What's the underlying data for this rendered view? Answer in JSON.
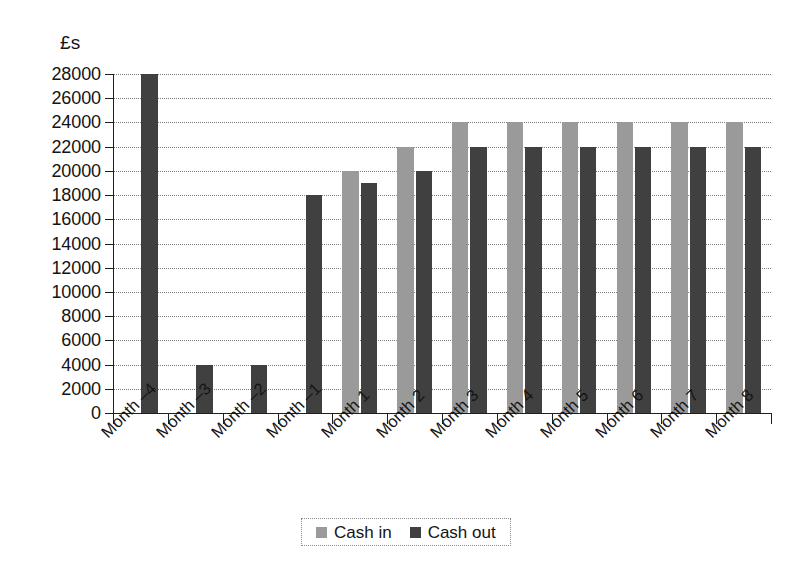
{
  "chart_data": {
    "type": "bar",
    "title": "",
    "subtitle": "",
    "xlabel": "",
    "ylabel": "£s",
    "ylim": [
      0,
      28000
    ],
    "ytick_step": 2000,
    "yticks": [
      0,
      2000,
      4000,
      6000,
      8000,
      10000,
      12000,
      14000,
      16000,
      18000,
      20000,
      22000,
      24000,
      26000,
      28000
    ],
    "ytick_labels": [
      "0",
      "2000",
      "4000",
      "6000",
      "8000",
      "10000",
      "12000",
      "14000",
      "16000",
      "18000",
      "20000",
      "22000",
      "24000",
      "26000",
      "28000"
    ],
    "grid": true,
    "grid_axis": "y",
    "legend_position": "bottom",
    "categories": [
      "Month –4",
      "Month –3",
      "Month –2",
      "Month –1",
      "Month 1",
      "Month 2",
      "Month 3",
      "Month 4",
      "Month 5",
      "Month 6",
      "Month 7",
      "Month 8"
    ],
    "series": [
      {
        "name": "Cash in",
        "color": "#9a9a9a",
        "values": [
          null,
          null,
          null,
          null,
          20000,
          22000,
          24000,
          24000,
          24000,
          24000,
          24000,
          24000
        ]
      },
      {
        "name": "Cash out",
        "color": "#404040",
        "values": [
          28000,
          4000,
          4000,
          18000,
          19000,
          20000,
          22000,
          22000,
          22000,
          22000,
          22000,
          22000
        ]
      }
    ]
  },
  "legend": {
    "items": [
      {
        "label": "Cash in",
        "color": "#9a9a9a"
      },
      {
        "label": "Cash out",
        "color": "#404040"
      }
    ]
  },
  "colors": {
    "cash_in": "#9a9a9a",
    "cash_out": "#404040",
    "axis": "#1f1f1f",
    "grid": "#7d7d7d",
    "background": "#ffffff"
  }
}
